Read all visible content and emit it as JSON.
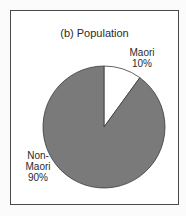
{
  "chart_data": {
    "type": "pie",
    "title": "(b) Population",
    "categories": [
      "Maori",
      "Non-Maori"
    ],
    "values": [
      10,
      90
    ],
    "labels": [
      {
        "name_line1": "Maori",
        "name_line2": "",
        "percent": "10%"
      },
      {
        "name_line1": "Non-",
        "name_line2": "Maori",
        "percent": "90%"
      }
    ],
    "colors": {
      "Maori": "#ffffff",
      "Non-Maori": "#7a7a7a",
      "outline": "#3a3a3a",
      "frame": "#4a4a4a"
    },
    "start_angle_deg": 0,
    "direction": "clockwise",
    "legend": "none (direct labels)"
  }
}
